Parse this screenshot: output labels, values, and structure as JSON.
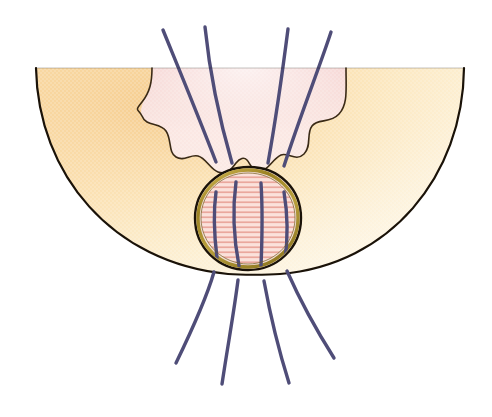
{
  "figure": {
    "title": "Anatomical cross-section diagram",
    "background_color": "#ffffff",
    "width": 492,
    "height": 417
  },
  "colors": {
    "outline_dark": "#1a1208",
    "bowl_tan_light": "#fdf6e3",
    "bowl_tan_mid": "#fbe3b6",
    "bowl_tan_deep": "#f6cf93",
    "inner_pink_light": "#fbe6e2",
    "inner_pink_mid": "#f5cfcb",
    "inner_pink_deep": "#efbcb8",
    "ganglion_fill": "#fadcd6",
    "ganglion_hatch": "#e8a79e",
    "ganglion_gold": "#a98c28",
    "ganglion_gold_light": "#d9c264",
    "fiber_purple": "#4f4d78",
    "fiber_purple_dark": "#3f3d66"
  },
  "regions": {
    "outer_bowl": {
      "name": "outer-bowl-region",
      "label": "Outer hemispherical tissue field",
      "fill_description": "tan to cream radial gradient",
      "stroke_width": 2.2
    },
    "inner_zone": {
      "name": "inner-lobed-zone",
      "label": "Lobed pink inner zone",
      "fill_description": "pink gradient fading upward",
      "lobe_count": 6,
      "stroke_width": 1.6
    },
    "ganglion": {
      "name": "ganglion-body",
      "label": "Oval ganglion body",
      "center_x": 248,
      "center_y": 218,
      "radius_x": 50,
      "radius_y": 49,
      "hatch_line_count": 26,
      "hatch_orientation": "horizontal",
      "outer_stroke_width": 2.4,
      "gold_band_width": 3.4
    }
  },
  "fibers": {
    "label": "Nerve fibre bundle",
    "stroke_width": 3.4,
    "upper_count": 4,
    "lower_count": 4,
    "through_count": 4,
    "upper": [
      {
        "id": "upper-fiber-1",
        "d": "M 163,30 C 176,62 196,110 216,162"
      },
      {
        "id": "upper-fiber-2",
        "d": "M 205,27 C 209,66 219,118 232,163"
      },
      {
        "id": "upper-fiber-3",
        "d": "M 288,29 C 283,68 276,118 268,163"
      },
      {
        "id": "upper-fiber-4",
        "d": "M 331,32 C 320,66 300,116 284,166"
      }
    ],
    "through": [
      {
        "id": "ganglion-fiber-1",
        "d": "M 216,196 C 213,214 214,232 217,255"
      },
      {
        "id": "ganglion-fiber-2",
        "d": "M 236,186 C 232,212 234,238 239,262"
      },
      {
        "id": "ganglion-fiber-3",
        "d": "M 260,187 C 262,214 262,240 261,262"
      },
      {
        "id": "ganglion-fiber-4",
        "d": "M 283,196 C 287,216 287,236 285,256"
      }
    ],
    "lower": [
      {
        "id": "lower-fiber-1",
        "d": "M 214,272 C 206,300 192,330 176,363"
      },
      {
        "id": "lower-fiber-2",
        "d": "M 238,280 C 234,312 228,344 222,384"
      },
      {
        "id": "lower-fiber-3",
        "d": "M 264,281 C 270,314 278,348 289,383"
      },
      {
        "id": "lower-fiber-4",
        "d": "M 287,271 C 299,298 315,328 334,358"
      }
    ]
  },
  "geometry": {
    "bowl_path": "M 36,68 L 464,68 C 463,175 391,264 280,274 C 268,275 240,275 228,274 C 112,263 38,173 36,68 Z",
    "bowl_top_y": 68,
    "bowl_left_x": 36,
    "bowl_right_x": 464,
    "bowl_bottom_y": 275,
    "inner_zone_path": "M 152,68 L 346,68 C 346,90 348,104 339,114 C 330,124 318,118 312,126 C 306,134 312,146 304,154 C 296,162 288,152 281,155 C 272,159 268,172 258,171 C 251,170 250,163 247,160 C 244,157 240,158 236,163 C 231,170 226,175 218,172 C 210,169 206,158 198,156 C 190,154 184,162 176,157 C 168,152 172,140 166,131 C 160,122 146,127 142,116 C 138,105 150,92 152,80 Z"
  }
}
